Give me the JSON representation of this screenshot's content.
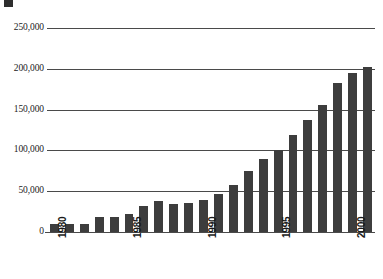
{
  "chart_data": {
    "type": "bar",
    "title": "",
    "xlabel": "",
    "ylabel": "",
    "ylim": [
      0,
      250000
    ],
    "grid": true,
    "legend": null,
    "orientation": "vertical",
    "bar_color": "#3d3d3d",
    "background_color": "#ffffff",
    "gridline_color": "#4a4a4a",
    "y_ticks": [
      {
        "value": 250000,
        "label": "250,000"
      },
      {
        "value": 200000,
        "label": "200,000"
      },
      {
        "value": 150000,
        "label": "150,000"
      },
      {
        "value": 100000,
        "label": "100,000"
      },
      {
        "value": 50000,
        "label": "50,000"
      },
      {
        "value": 0,
        "label": "0"
      }
    ],
    "x_tick_labels": [
      "1980",
      "1985",
      "1990",
      "1995",
      "2000"
    ],
    "x_tick_categories": [
      "1980",
      "1985",
      "1990",
      "1995",
      "2000"
    ],
    "categories": [
      "1980",
      "1981",
      "1982",
      "1983",
      "1984",
      "1985",
      "1986",
      "1987",
      "1988",
      "1989",
      "1990",
      "1991",
      "1992",
      "1993",
      "1994",
      "1995",
      "1996",
      "1997",
      "1998",
      "1999",
      "2000",
      "2001"
    ],
    "values": [
      10000,
      10000,
      10000,
      18000,
      18000,
      22000,
      32000,
      38000,
      34000,
      35000,
      39000,
      46000,
      58000,
      75000,
      90000,
      100000,
      119000,
      137000,
      156000,
      183000,
      195000,
      202000
    ]
  }
}
